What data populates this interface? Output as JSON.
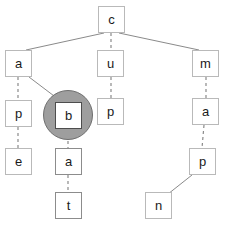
{
  "diagram": {
    "type": "tree",
    "colors": {
      "node_border": "#b9b9b9",
      "node_border_dark": "#8c8c8c",
      "node_fill": "#ffffff",
      "edge": "#8a8a8a",
      "highlight_fill": "#9e9e9e",
      "highlight_stroke": "#6f6f6f",
      "label": "#1a1a1a",
      "background": "#ffffff"
    },
    "highlight": {
      "node_id": "b",
      "shape": "circle",
      "cx": 68,
      "cy": 115,
      "r": 25
    },
    "nodes": [
      {
        "id": "c",
        "label": "c",
        "x": 98,
        "y": 6,
        "emphasis": "normal"
      },
      {
        "id": "a1",
        "label": "a",
        "x": 5,
        "y": 50,
        "emphasis": "normal"
      },
      {
        "id": "u",
        "label": "u",
        "x": 97,
        "y": 50,
        "emphasis": "normal"
      },
      {
        "id": "m",
        "label": "m",
        "x": 192,
        "y": 50,
        "emphasis": "normal"
      },
      {
        "id": "p1",
        "label": "p",
        "x": 5,
        "y": 100,
        "emphasis": "normal"
      },
      {
        "id": "b",
        "label": "b",
        "x": 55,
        "y": 102,
        "emphasis": "selected"
      },
      {
        "id": "p2",
        "label": "p",
        "x": 97,
        "y": 98,
        "emphasis": "normal"
      },
      {
        "id": "a2",
        "label": "a",
        "x": 192,
        "y": 98,
        "emphasis": "normal"
      },
      {
        "id": "e",
        "label": "e",
        "x": 5,
        "y": 148,
        "emphasis": "normal"
      },
      {
        "id": "a3",
        "label": "a",
        "x": 55,
        "y": 148,
        "emphasis": "dark"
      },
      {
        "id": "p3",
        "label": "p",
        "x": 189,
        "y": 148,
        "emphasis": "normal"
      },
      {
        "id": "t",
        "label": "t",
        "x": 55,
        "y": 192,
        "emphasis": "dark"
      },
      {
        "id": "n",
        "label": "n",
        "x": 145,
        "y": 192,
        "emphasis": "normal"
      }
    ],
    "edges": [
      {
        "from": "c",
        "to": "a1",
        "style": "solid",
        "x1": 104,
        "y1": 33,
        "x2": 26,
        "y2": 50
      },
      {
        "from": "c",
        "to": "u",
        "style": "dashed",
        "x1": 111,
        "y1": 33,
        "x2": 111,
        "y2": 50
      },
      {
        "from": "c",
        "to": "m",
        "style": "solid",
        "x1": 119,
        "y1": 33,
        "x2": 199,
        "y2": 50
      },
      {
        "from": "a1",
        "to": "p1",
        "style": "dashed",
        "x1": 18,
        "y1": 77,
        "x2": 18,
        "y2": 100
      },
      {
        "from": "a1",
        "to": "b",
        "style": "solid",
        "x1": 29,
        "y1": 77,
        "x2": 62,
        "y2": 102
      },
      {
        "from": "u",
        "to": "p2",
        "style": "dashed",
        "x1": 111,
        "y1": 77,
        "x2": 111,
        "y2": 98
      },
      {
        "from": "m",
        "to": "a2",
        "style": "dashed",
        "x1": 206,
        "y1": 77,
        "x2": 206,
        "y2": 98
      },
      {
        "from": "p1",
        "to": "e",
        "style": "dashed",
        "x1": 18,
        "y1": 127,
        "x2": 18,
        "y2": 148
      },
      {
        "from": "b",
        "to": "a3",
        "style": "dashed",
        "x1": 68,
        "y1": 129,
        "x2": 68,
        "y2": 148
      },
      {
        "from": "a2",
        "to": "p3",
        "style": "dashed",
        "x1": 204,
        "y1": 125,
        "x2": 202,
        "y2": 148
      },
      {
        "from": "a3",
        "to": "t",
        "style": "dashed",
        "x1": 68,
        "y1": 175,
        "x2": 68,
        "y2": 192
      },
      {
        "from": "p3",
        "to": "n",
        "style": "solid",
        "x1": 192,
        "y1": 175,
        "x2": 168,
        "y2": 194
      }
    ]
  }
}
